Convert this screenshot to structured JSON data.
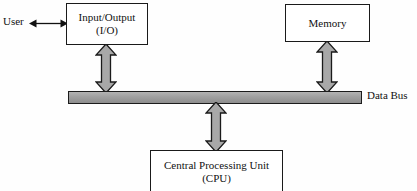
{
  "diagram": {
    "background_color": "#fefefe",
    "line_color": "#1a1a1a",
    "arrow_fill_color": "#a8a8a8",
    "bus_fill_color": "#a0a0a0"
  },
  "nodes": {
    "user": {
      "label": "User"
    },
    "io": {
      "line1": "Input/Output",
      "line2": "(I/O)"
    },
    "memory": {
      "line1": "Memory"
    },
    "cpu": {
      "line1": "Central Processing Unit",
      "line2": "(CPU)"
    },
    "bus": {
      "label": "Data Bus"
    }
  },
  "connections": [
    {
      "name": "user-io",
      "from": "User",
      "to": "Input/Output (I/O)",
      "style": "thin-double-arrow",
      "orientation": "horizontal"
    },
    {
      "name": "io-bus",
      "from": "Input/Output (I/O)",
      "to": "Data Bus",
      "style": "thick-double-arrow",
      "orientation": "vertical"
    },
    {
      "name": "memory-bus",
      "from": "Memory",
      "to": "Data Bus",
      "style": "thick-double-arrow",
      "orientation": "vertical"
    },
    {
      "name": "cpu-bus",
      "from": "Data Bus",
      "to": "Central Processing Unit (CPU)",
      "style": "thick-double-arrow",
      "orientation": "vertical"
    }
  ]
}
